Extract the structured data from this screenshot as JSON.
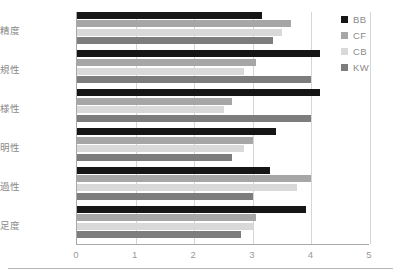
{
  "chart_data": {
    "type": "bar",
    "orientation": "horizontal",
    "title": "",
    "xlabel": "",
    "ylabel": "",
    "xlim": [
      0,
      5
    ],
    "xticks": [
      "0",
      "1",
      "2",
      "3",
      "4",
      "5"
    ],
    "grid": true,
    "legend_position": "right",
    "categories": [
      "推薦精度",
      "推薦新規性",
      "推薦多様性",
      "説明性",
      "透過性",
      "総合満足度"
    ],
    "series": [
      {
        "name": "BB",
        "color": "#161616",
        "values": [
          3.15,
          4.15,
          4.15,
          3.4,
          3.3,
          3.9
        ]
      },
      {
        "name": "CF",
        "color": "#a6a6a6",
        "values": [
          3.65,
          3.05,
          2.65,
          3.0,
          4.0,
          3.05
        ]
      },
      {
        "name": "CB",
        "color": "#d9d9d9",
        "values": [
          3.5,
          2.85,
          2.5,
          2.85,
          3.75,
          3.0
        ]
      },
      {
        "name": "KW",
        "color": "#7d7d7d",
        "values": [
          3.35,
          4.0,
          4.0,
          2.65,
          3.0,
          2.8
        ]
      }
    ]
  },
  "legend": {
    "items": [
      {
        "label": "BB"
      },
      {
        "label": "CF"
      },
      {
        "label": "CB"
      },
      {
        "label": "KW"
      }
    ]
  },
  "colors": {
    "series_bb": "#161616",
    "series_cf": "#a6a6a6",
    "series_cb": "#d9d9d9",
    "series_kw": "#7d7d7d",
    "axis": "#a8a8a8",
    "grid": "#d6d6d6",
    "text": "#8a8a8a",
    "background": "#ffffff"
  }
}
